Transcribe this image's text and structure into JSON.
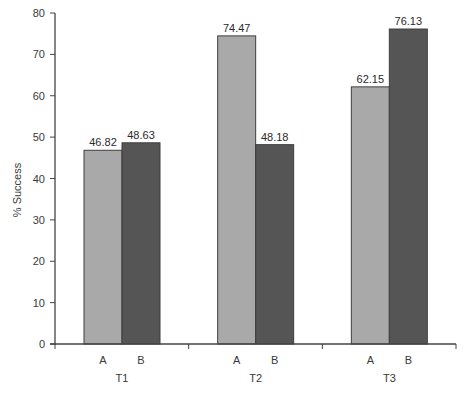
{
  "chart_data": {
    "type": "bar",
    "title": "",
    "xlabel": "",
    "ylabel": "% Success",
    "ylim": [
      0,
      80
    ],
    "yticks": [
      0,
      10,
      20,
      30,
      40,
      50,
      60,
      70,
      80
    ],
    "grid": false,
    "legend": null,
    "categories": [
      "T1",
      "T2",
      "T3"
    ],
    "subcategories": [
      "A",
      "B"
    ],
    "series": [
      {
        "name": "A",
        "values": [
          46.82,
          74.47,
          62.15
        ],
        "color": "#a9a9a9"
      },
      {
        "name": "B",
        "values": [
          48.63,
          48.18,
          76.13
        ],
        "color": "#555555"
      }
    ],
    "value_labels": [
      [
        "46.82",
        "48.63"
      ],
      [
        "74.47",
        "48.18"
      ],
      [
        "62.15",
        "76.13"
      ]
    ]
  },
  "colors": {
    "axis": "#444444",
    "bar_outline": "#3f3f3f",
    "series_a": "#a9a9a9",
    "series_b": "#555555"
  }
}
